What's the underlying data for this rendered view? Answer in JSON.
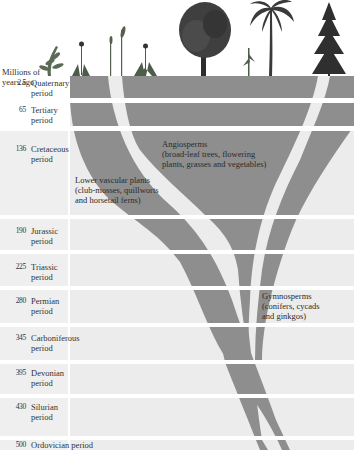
{
  "axis_title": [
    "Millions of",
    "years ago"
  ],
  "periods": [
    {
      "age": "2.5",
      "name_lines": [
        "Quaternary",
        "period"
      ]
    },
    {
      "age": "65",
      "name_lines": [
        "Tertiary",
        "period"
      ]
    },
    {
      "age": "136",
      "name_lines": [
        "Cretaceous",
        "period"
      ]
    },
    {
      "age": "190",
      "name_lines": [
        "Jurassic",
        "period"
      ]
    },
    {
      "age": "225",
      "name_lines": [
        "Triassic",
        "period"
      ]
    },
    {
      "age": "280",
      "name_lines": [
        "Permian",
        "period"
      ]
    },
    {
      "age": "345",
      "name_lines": [
        "Carboniferous",
        "period"
      ]
    },
    {
      "age": "395",
      "name_lines": [
        "Devonian",
        "period"
      ]
    },
    {
      "age": "430",
      "name_lines": [
        "Silurian",
        "period"
      ]
    },
    {
      "age": "500",
      "name_lines": [
        "Ordovician  period"
      ]
    }
  ],
  "groups": {
    "angiosperms": [
      "Angiosperms",
      "(broad-leaf trees, flowering",
      "plants, grasses and vegetables)"
    ],
    "lower_vascular": [
      "Lower vascular plants",
      "(club-mosses, quillworts",
      "and horsetail ferns)"
    ],
    "gymnosperms": [
      "Gymnosperms",
      "(conifers, cycads",
      "and ginkgos)"
    ]
  },
  "colors": {
    "band": "#8e8e8e",
    "strip_dark": "#8f8f8f",
    "strip_light": "#ebebeb",
    "background": "#ffffff"
  },
  "illustrations": [
    "fern",
    "dandelion",
    "reed",
    "grass",
    "thistle",
    "broadleaf-tree",
    "corn",
    "palm-tree",
    "conifer-tree"
  ]
}
